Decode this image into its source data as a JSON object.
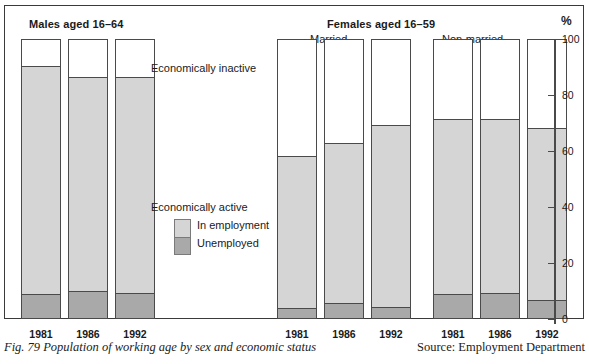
{
  "figure": {
    "caption": "Fig. 79  Population of working age by sex and economic status",
    "source": "Source: Employment Department"
  },
  "axis": {
    "percent_symbol": "%",
    "ticks": [
      "100",
      "80",
      "60",
      "40",
      "20",
      "0"
    ]
  },
  "headings": {
    "males": "Males aged 16–64",
    "females": "Females aged 16–59",
    "married": "Married",
    "non_married": "Non-married"
  },
  "legend": {
    "inactive": "Economically inactive",
    "active": "Economically active",
    "in_employment": "In employment",
    "unemployed": "Unemployed"
  },
  "colors": {
    "inactive": "#ffffff",
    "in_employment": "#d5d5d5",
    "unemployed": "#a9a9a9",
    "outline": "#4a4a4a",
    "frame": "#3a3a3a"
  },
  "chart_data": {
    "type": "bar",
    "title": "Population of working age by sex and economic status",
    "subtitle": "",
    "xlabel": "",
    "ylabel": "%",
    "ylim": [
      0,
      100
    ],
    "yticks": [
      0,
      20,
      40,
      60,
      80,
      100
    ],
    "grid": false,
    "stacked": true,
    "legend_position": "inline",
    "groups": [
      {
        "name": "Males aged 16–64",
        "sub_name": "",
        "categories": [
          "1981",
          "1986",
          "1992"
        ]
      },
      {
        "name": "Females aged 16–59",
        "sub_name": "Married",
        "categories": [
          "1981",
          "1986",
          "1992"
        ]
      },
      {
        "name": "Females aged 16–59",
        "sub_name": "Non-married",
        "categories": [
          "1981",
          "1986",
          "1992"
        ]
      }
    ],
    "categories": [
      "1981",
      "1986",
      "1992",
      "1981",
      "1986",
      "1992",
      "1981",
      "1986",
      "1992"
    ],
    "series": [
      {
        "name": "Unemployed",
        "color": "#a9a9a9",
        "values": [
          8.5,
          9.5,
          9.0,
          3.5,
          5.5,
          4.0,
          8.5,
          9.0,
          6.5
        ]
      },
      {
        "name": "In employment",
        "color": "#d5d5d5",
        "values": [
          81.5,
          76.5,
          77.0,
          54.5,
          57.0,
          65.0,
          62.5,
          62.0,
          61.5
        ]
      },
      {
        "name": "Economically inactive",
        "color": "#ffffff",
        "values": [
          10.0,
          14.0,
          14.0,
          42.0,
          37.5,
          31.0,
          29.0,
          29.0,
          32.0
        ]
      }
    ],
    "bars": [
      {
        "group": "Males aged 16–64",
        "sub_group": "",
        "category": "1981",
        "unemployed": 8.5,
        "in_employment": 81.5,
        "economically_active": 90.0,
        "economically_inactive": 10.0
      },
      {
        "group": "Males aged 16–64",
        "sub_group": "",
        "category": "1986",
        "unemployed": 9.5,
        "in_employment": 76.5,
        "economically_active": 86.0,
        "economically_inactive": 14.0
      },
      {
        "group": "Males aged 16–64",
        "sub_group": "",
        "category": "1992",
        "unemployed": 9.0,
        "in_employment": 77.0,
        "economically_active": 86.0,
        "economically_inactive": 14.0
      },
      {
        "group": "Females aged 16–59",
        "sub_group": "Married",
        "category": "1981",
        "unemployed": 3.5,
        "in_employment": 54.5,
        "economically_active": 58.0,
        "economically_inactive": 42.0
      },
      {
        "group": "Females aged 16–59",
        "sub_group": "Married",
        "category": "1986",
        "unemployed": 5.5,
        "in_employment": 57.0,
        "economically_active": 62.5,
        "economically_inactive": 37.5
      },
      {
        "group": "Females aged 16–59",
        "sub_group": "Married",
        "category": "1992",
        "unemployed": 4.0,
        "in_employment": 65.0,
        "economically_active": 69.0,
        "economically_inactive": 31.0
      },
      {
        "group": "Females aged 16–59",
        "sub_group": "Non-married",
        "category": "1981",
        "unemployed": 8.5,
        "in_employment": 62.5,
        "economically_active": 71.0,
        "economically_inactive": 29.0
      },
      {
        "group": "Females aged 16–59",
        "sub_group": "Non-married",
        "category": "1986",
        "unemployed": 9.0,
        "in_employment": 62.0,
        "economically_active": 71.0,
        "economically_inactive": 29.0
      },
      {
        "group": "Females aged 16–59",
        "sub_group": "Non-married",
        "category": "1992",
        "unemployed": 6.5,
        "in_employment": 61.5,
        "economically_active": 68.0,
        "economically_inactive": 32.0
      }
    ]
  },
  "bar_layout": {
    "x_positions": [
      16,
      63,
      110,
      272,
      319,
      366,
      428,
      475,
      522
    ]
  }
}
